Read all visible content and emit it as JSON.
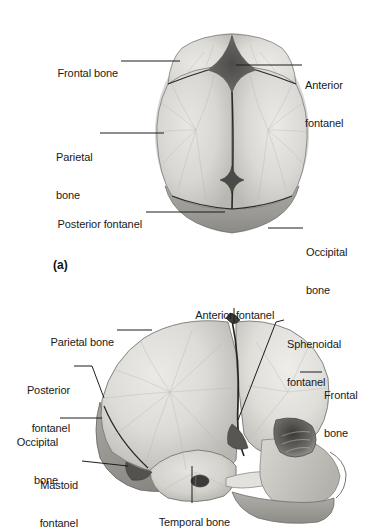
{
  "figure": {
    "background_color": "#ffffff",
    "text_color": "#1a1a1a",
    "leader_color": "#1c1c1c",
    "bone_light": "#dcdad6",
    "bone_mid": "#c4c2bd",
    "bone_dark": "#9a9894",
    "fontanel_dark": "#5a5a58"
  },
  "panels": [
    {
      "id": "panel-a",
      "letter": "(a)",
      "view": "superior view of fetal skull",
      "labels": [
        {
          "name": "frontal-bone",
          "lines": [
            "Frontal bone"
          ],
          "align": "right"
        },
        {
          "name": "anterior-fontanel",
          "lines": [
            "Anterior",
            "fontanel"
          ],
          "align": "left"
        },
        {
          "name": "parietal-bone",
          "lines": [
            "Parietal",
            "bone"
          ],
          "align": "left"
        },
        {
          "name": "posterior-fontanel",
          "lines": [
            "Posterior fontanel"
          ],
          "align": "right"
        },
        {
          "name": "occipital-bone",
          "lines": [
            "Occipital",
            "bone"
          ],
          "align": "left"
        }
      ]
    },
    {
      "id": "panel-b",
      "letter": "",
      "view": "lateral view of fetal skull",
      "labels": [
        {
          "name": "anterior-fontanel",
          "lines": [
            "Anterior fontanel"
          ],
          "align": "left"
        },
        {
          "name": "sphenoidal-fontanel",
          "lines": [
            "Sphenoidal",
            "fontanel"
          ],
          "align": "left"
        },
        {
          "name": "parietal-bone",
          "lines": [
            "Parietal bone"
          ],
          "align": "left"
        },
        {
          "name": "frontal-bone",
          "lines": [
            "Frontal",
            "bone"
          ],
          "align": "left"
        },
        {
          "name": "posterior-fontanel",
          "lines": [
            "Posterior",
            "fontanel"
          ],
          "align": "left"
        },
        {
          "name": "occipital-bone",
          "lines": [
            "Occipital",
            "bone"
          ],
          "align": "left"
        },
        {
          "name": "mastoid-fontanel",
          "lines": [
            "Mastoid",
            "fontanel"
          ],
          "align": "left"
        },
        {
          "name": "temporal-bone",
          "lines": [
            "Temporal bone"
          ],
          "align": "left"
        }
      ]
    }
  ],
  "panel_a": {
    "letter": "(a)",
    "frontal_bone": "Frontal bone",
    "anterior_fontanel_l1": "Anterior",
    "anterior_fontanel_l2": "fontanel",
    "parietal_bone_l1": "Parietal",
    "parietal_bone_l2": "bone",
    "posterior_fontanel": "Posterior fontanel",
    "occipital_bone_l1": "Occipital",
    "occipital_bone_l2": "bone"
  },
  "panel_b": {
    "anterior_fontanel": "Anterior fontanel",
    "sphenoidal_fontanel_l1": "Sphenoidal",
    "sphenoidal_fontanel_l2": "fontanel",
    "parietal_bone": "Parietal bone",
    "frontal_bone_l1": "Frontal",
    "frontal_bone_l2": "bone",
    "posterior_fontanel_l1": "Posterior",
    "posterior_fontanel_l2": "fontanel",
    "occipital_bone_l1": "Occipital",
    "occipital_bone_l2": "bone",
    "mastoid_fontanel_l1": "Mastoid",
    "mastoid_fontanel_l2": "fontanel",
    "temporal_bone": "Temporal bone"
  }
}
